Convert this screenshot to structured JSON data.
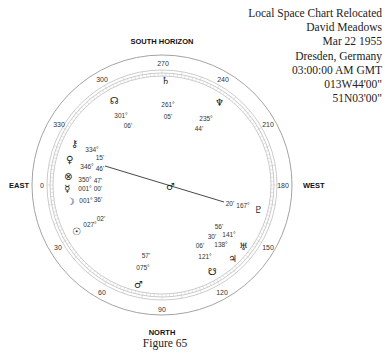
{
  "header": {
    "title": "Local Space Chart  Relocated",
    "name": "David Meadows",
    "date": "Mar 22 1955",
    "location": "Dresden, Germany",
    "time": "03:00:00 AM GMT",
    "longitude": "013W44'00\"",
    "latitude": "51N03'00\""
  },
  "directions": {
    "top": "SOUTH  HORIZON",
    "bottom": "NORTH",
    "left": "EAST",
    "right": "WEST"
  },
  "degree_labels": [
    "0",
    "30",
    "60",
    "90",
    "120",
    "150",
    "180",
    "210",
    "240",
    "270",
    "300",
    "330"
  ],
  "planets": [
    {
      "name": "Saturn",
      "icon": "saturn-icon",
      "glyph": "♄",
      "deg": "261°",
      "min": "05'"
    },
    {
      "name": "Neptune",
      "icon": "neptune-icon",
      "glyph": "♆",
      "deg": "235°",
      "min": "44'"
    },
    {
      "name": "North Node",
      "icon": "north-node-icon",
      "glyph": "☊",
      "deg": "301°",
      "min": "06'"
    },
    {
      "name": "Chiron",
      "icon": "chiron-icon",
      "glyph": "⚷",
      "deg": "334°",
      "min": "15'"
    },
    {
      "name": "Venus",
      "icon": "venus-icon",
      "glyph": "♀",
      "deg": "346°",
      "min": "46'"
    },
    {
      "name": "Part of Fortune",
      "icon": "fortune-icon",
      "glyph": "⊗",
      "deg": "350°",
      "min": "47'"
    },
    {
      "name": "Mercury",
      "icon": "mercury-icon",
      "glyph": "☿",
      "deg": "001°",
      "min": "00'"
    },
    {
      "name": "Moon",
      "icon": "moon-icon",
      "glyph": "☽",
      "deg": "001°",
      "min": "36'"
    },
    {
      "name": "Sun",
      "icon": "sun-icon",
      "glyph": "☉",
      "deg": "027°",
      "min": "02'"
    },
    {
      "name": "Mars",
      "icon": "mars-icon",
      "glyph": "♂",
      "deg": "075°",
      "min": "57'"
    },
    {
      "name": "South Node",
      "icon": "south-node-icon",
      "glyph": "☋",
      "deg": "121°",
      "min": "06'"
    },
    {
      "name": "Jupiter",
      "icon": "jupiter-icon",
      "glyph": "♃",
      "deg": "138°",
      "min": "30'"
    },
    {
      "name": "Uranus",
      "icon": "uranus-icon",
      "glyph": "♅",
      "deg": "141°",
      "min": "56'"
    },
    {
      "name": "Pluto",
      "icon": "pluto-icon",
      "glyph": "♇",
      "deg": "167°",
      "min": "20'"
    }
  ],
  "center_marker": "♂",
  "caption": "Figure 65"
}
